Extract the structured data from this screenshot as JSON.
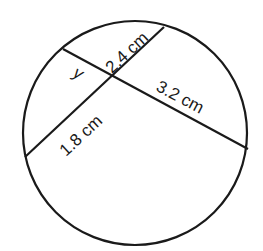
{
  "diagram": {
    "type": "intersecting-chords-in-circle",
    "stroke_color": "#1a1a1a",
    "background": "#ffffff",
    "circle": {
      "cx": 135,
      "cy": 133,
      "r": 112
    },
    "chords": [
      {
        "id": "chord-a",
        "x1": 63,
        "y1": 49,
        "x2": 248,
        "y2": 149
      },
      {
        "id": "chord-b",
        "x1": 164,
        "y1": 27,
        "x2": 25,
        "y2": 157
      }
    ],
    "intersection": {
      "x": 114,
      "y": 77
    },
    "labels": {
      "y": "y",
      "seg_2_4": "2.4 cm",
      "seg_3_2": "3.2 cm",
      "seg_1_8": "1.8 cm"
    }
  }
}
